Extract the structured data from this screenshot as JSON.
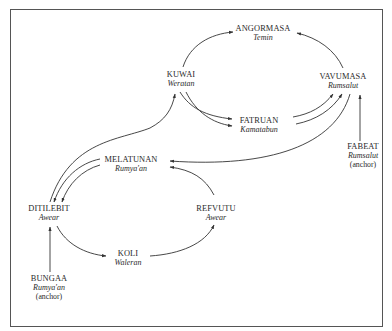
{
  "diagram": {
    "type": "directed-graph",
    "nodes": [
      {
        "id": "angormasa",
        "name": "ANGORMASA",
        "sub": "Temin"
      },
      {
        "id": "kuwai",
        "name": "KUWAI",
        "sub": "Weratan"
      },
      {
        "id": "vavumasa",
        "name": "VAVUMASA",
        "sub": "Rumsalut"
      },
      {
        "id": "fatruan",
        "name": "FATRUAN",
        "sub": "Kamatabun"
      },
      {
        "id": "fabeat",
        "name": "FABEAT",
        "sub": "Rumsalut",
        "note": "(anchor)"
      },
      {
        "id": "melatunan",
        "name": "MELATUNAN",
        "sub": "Rumya'an"
      },
      {
        "id": "ditilebit",
        "name": "DITILEBIT",
        "sub": "Awear"
      },
      {
        "id": "refvutu",
        "name": "REFVUTU",
        "sub": "Awear"
      },
      {
        "id": "koli",
        "name": "KOLI",
        "sub": "Waleran"
      },
      {
        "id": "bungaa",
        "name": "BUNGAA",
        "sub": "Rumya'an",
        "note": "(anchor)"
      }
    ],
    "edges": [
      {
        "from": "KUWAI",
        "to": "ANGORMASA"
      },
      {
        "from": "VAVUMASA",
        "to": "ANGORMASA"
      },
      {
        "from": "KUWAI",
        "to": "FATRUAN"
      },
      {
        "from": "KUWAI",
        "to": "FATRUAN"
      },
      {
        "from": "FATRUAN",
        "to": "VAVUMASA"
      },
      {
        "from": "FATRUAN",
        "to": "VAVUMASA"
      },
      {
        "from": "FABEAT",
        "to": "VAVUMASA"
      },
      {
        "from": "VAVUMASA",
        "to": "MELATUNAN"
      },
      {
        "from": "DITILEBIT",
        "to": "KUWAI"
      },
      {
        "from": "MELATUNAN",
        "to": "DITILEBIT"
      },
      {
        "from": "MELATUNAN",
        "to": "DITILEBIT"
      },
      {
        "from": "REFVUTU",
        "to": "MELATUNAN"
      },
      {
        "from": "DITILEBIT",
        "to": "KOLI"
      },
      {
        "from": "KOLI",
        "to": "REFVUTU"
      },
      {
        "from": "BUNGAA",
        "to": "DITILEBIT"
      }
    ]
  },
  "colors": {
    "line": "#333333",
    "frame": "#555555",
    "background": "#ffffff"
  }
}
